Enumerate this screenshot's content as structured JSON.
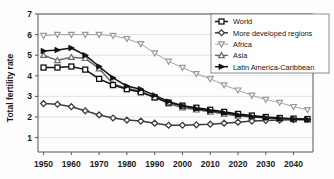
{
  "chart_data": {
    "type": "line",
    "title": "",
    "xlabel": "",
    "ylabel": "Total fertility rate",
    "xlim": [
      1948,
      2047
    ],
    "ylim": [
      0.3,
      7
    ],
    "grid": true,
    "legend_position": "top-right",
    "x_ticks": [
      1950,
      1960,
      1970,
      1980,
      1990,
      2000,
      2010,
      2020,
      2030,
      2040
    ],
    "x_tick_labels": [
      "1950",
      "1960",
      "1970",
      "1980",
      "1990",
      "2000",
      "2010",
      "2020",
      "2030",
      "2040"
    ],
    "y_ticks": [
      1,
      2,
      3,
      4,
      5,
      6,
      7
    ],
    "y_tick_labels": [
      "1",
      "2",
      "3",
      "4",
      "5",
      "6",
      "7"
    ],
    "x": [
      1950,
      1955,
      1960,
      1965,
      1970,
      1975,
      1980,
      1985,
      1990,
      1995,
      2000,
      2005,
      2010,
      2015,
      2020,
      2025,
      2030,
      2035,
      2040,
      2045
    ],
    "series": [
      {
        "name": "World",
        "marker": "square-open",
        "color": "#111111",
        "values": [
          4.4,
          4.4,
          4.45,
          4.3,
          3.85,
          3.55,
          3.35,
          3.2,
          2.95,
          2.7,
          2.55,
          2.45,
          2.35,
          2.25,
          2.15,
          2.07,
          2.0,
          1.95,
          1.92,
          1.9
        ]
      },
      {
        "name": "More developed regions",
        "marker": "diamond-open",
        "color": "#3c3c3c",
        "values": [
          2.65,
          2.62,
          2.5,
          2.3,
          2.1,
          1.95,
          1.85,
          1.8,
          1.7,
          1.6,
          1.6,
          1.62,
          1.65,
          1.7,
          1.75,
          1.8,
          1.83,
          1.85,
          1.87,
          1.88
        ]
      },
      {
        "name": "Africa",
        "marker": "triangle-down-open",
        "color": "#9a9a9a",
        "values": [
          5.95,
          6.0,
          6.0,
          6.0,
          6.0,
          5.95,
          5.8,
          5.55,
          5.1,
          4.7,
          4.4,
          4.1,
          3.85,
          3.55,
          3.3,
          3.05,
          2.85,
          2.7,
          2.5,
          2.35
        ]
      },
      {
        "name": "Asia",
        "marker": "triangle-up-open",
        "color": "#6a6a6a",
        "values": [
          5.0,
          4.75,
          4.9,
          4.85,
          4.35,
          3.6,
          3.4,
          3.25,
          2.95,
          2.65,
          2.45,
          2.35,
          2.25,
          2.15,
          2.05,
          2.0,
          1.95,
          1.9,
          1.88,
          1.87
        ]
      },
      {
        "name": "Latin America-Caribbean",
        "marker": "triangle-right-filled",
        "color": "#111111",
        "values": [
          5.2,
          5.25,
          5.35,
          5.0,
          4.45,
          3.9,
          3.5,
          3.35,
          3.05,
          2.75,
          2.55,
          2.4,
          2.3,
          2.2,
          2.1,
          2.02,
          1.97,
          1.93,
          1.9,
          1.88
        ]
      }
    ]
  },
  "legend": {
    "items": [
      {
        "label": "World"
      },
      {
        "label": "More developed regions"
      },
      {
        "label": "Africa"
      },
      {
        "label": "Asia"
      },
      {
        "label": "Latin America-Caribbean"
      }
    ]
  }
}
